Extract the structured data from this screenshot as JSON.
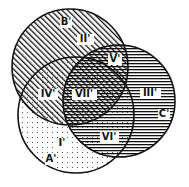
{
  "diagram": {
    "type": "venn",
    "sets": [
      {
        "id": "A",
        "label": "A'",
        "pattern": "dots",
        "cx": 76,
        "cy": 115,
        "r": 58
      },
      {
        "id": "B",
        "label": "B'",
        "pattern": "diagonal-hatch",
        "cx": 70,
        "cy": 67,
        "r": 58
      },
      {
        "id": "C",
        "label": "C'",
        "pattern": "horizontal-lines",
        "cx": 119,
        "cy": 101,
        "r": 56
      }
    ],
    "regions": [
      {
        "id": "I",
        "label": "I'",
        "x": 62,
        "y": 146
      },
      {
        "id": "II",
        "label": "II'",
        "x": 85,
        "y": 42
      },
      {
        "id": "III",
        "label": "III'",
        "x": 150,
        "y": 96
      },
      {
        "id": "IV",
        "label": "IV'",
        "x": 48,
        "y": 97
      },
      {
        "id": "V",
        "label": "V'",
        "x": 115,
        "y": 62
      },
      {
        "id": "VI",
        "label": "VI'",
        "x": 109,
        "y": 140
      },
      {
        "id": "VII",
        "label": "VII'",
        "x": 84,
        "y": 97
      }
    ],
    "set_label_positions": {
      "A": {
        "x": 51,
        "y": 162
      },
      "B": {
        "x": 66,
        "y": 25
      },
      "C": {
        "x": 164,
        "y": 117
      }
    },
    "colors": {
      "stroke": "#111111",
      "fill": "#111111",
      "background": "#ffffff"
    }
  }
}
